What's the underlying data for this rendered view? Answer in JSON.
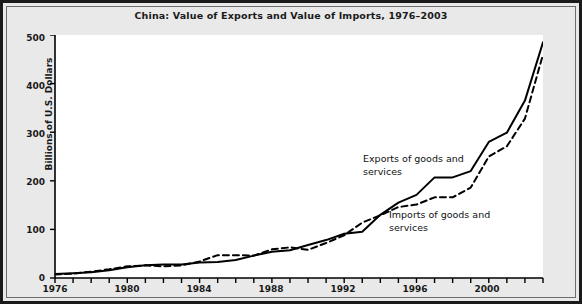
{
  "figure": {
    "title": "China: Value of Exports and Value of Imports, 1976–2003",
    "background_color": "#e9e9e9",
    "plot_background_color": "#ffffff",
    "border_color": "#1a1a1a",
    "line_color": "#000000"
  },
  "axes": {
    "y_title": "Billions of U.S. Dollars",
    "y_ticks": [
      "0",
      "100",
      "200",
      "300",
      "400",
      "500"
    ],
    "x_ticks_labeled": [
      "1976",
      "1980",
      "1984",
      "1988",
      "1992",
      "1996",
      "2000"
    ]
  },
  "annotations": {
    "exports": "Exports of goods and\nservices",
    "imports": "Imports of goods and\nservices"
  },
  "chart_data": {
    "type": "line",
    "title": "China: Value of Exports and Value of Imports, 1976–2003",
    "xlabel": "",
    "ylabel": "Billions of U.S. Dollars",
    "xlim": [
      1976,
      2003
    ],
    "ylim": [
      0,
      500
    ],
    "grid": false,
    "legend_position": "inline-annotations",
    "x": [
      1976,
      1977,
      1978,
      1979,
      1980,
      1981,
      1982,
      1983,
      1984,
      1985,
      1986,
      1987,
      1988,
      1989,
      1990,
      1991,
      1992,
      1993,
      1994,
      1995,
      1996,
      1997,
      1998,
      1999,
      2000,
      2001,
      2002,
      2003
    ],
    "series": [
      {
        "name": "Exports of goods and services",
        "style": "solid",
        "values": [
          8,
          10,
          12,
          16,
          22,
          26,
          28,
          28,
          32,
          33,
          37,
          46,
          54,
          57,
          68,
          78,
          91,
          95,
          130,
          155,
          171,
          207,
          207,
          220,
          280,
          299,
          365,
          485
        ]
      },
      {
        "name": "Imports of goods and services",
        "style": "dashed",
        "values": [
          7,
          9,
          13,
          18,
          24,
          26,
          24,
          26,
          34,
          47,
          47,
          46,
          59,
          63,
          58,
          72,
          88,
          114,
          129,
          146,
          151,
          166,
          166,
          186,
          250,
          271,
          328,
          460
        ]
      }
    ]
  }
}
